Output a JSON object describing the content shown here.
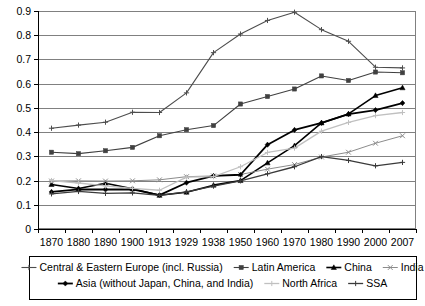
{
  "chart_data": {
    "type": "line",
    "title": "",
    "subtitle": "",
    "xlabel": "",
    "ylabel": "",
    "grid": true,
    "legend_position": "bottom",
    "ylim": [
      0,
      0.9
    ],
    "ytick_labels": [
      "0",
      "0.1",
      "0.2",
      "0.3",
      "0.4",
      "0.5",
      "0.6",
      "0.7",
      "0.8",
      "0.9"
    ],
    "ytick_values": [
      0,
      0.1,
      0.2,
      0.3,
      0.4,
      0.5,
      0.6,
      0.7,
      0.8,
      0.9
    ],
    "categories": [
      "1870",
      "1880",
      "1890",
      "1900",
      "1913",
      "1929",
      "1938",
      "1950",
      "1960",
      "1970",
      "1980",
      "1990",
      "2000",
      "2007"
    ],
    "series": [
      {
        "name": "Central & Eastern Europe (incl. Russia)",
        "color": "#4d4d4d",
        "width": 1.1,
        "marker": "plus",
        "values": [
          0.416,
          0.429,
          0.441,
          0.482,
          0.481,
          0.562,
          0.728,
          0.805,
          0.861,
          0.895,
          0.823,
          0.775,
          0.668,
          0.665
        ]
      },
      {
        "name": "Latin America",
        "color": "#404040",
        "width": 1.1,
        "marker": "square",
        "values": [
          0.317,
          0.311,
          0.323,
          0.337,
          0.385,
          0.41,
          0.427,
          0.516,
          0.547,
          0.578,
          0.632,
          0.613,
          0.648,
          0.645
        ]
      },
      {
        "name": "China",
        "color": "#000000",
        "width": 1.6,
        "marker": "triangle",
        "values": [
          0.184,
          0.167,
          0.189,
          0.166,
          0.139,
          0.152,
          0.181,
          0.2,
          0.273,
          0.344,
          0.438,
          0.475,
          0.551,
          0.583
        ]
      },
      {
        "name": "India",
        "color": "#8c8c8c",
        "width": 1.0,
        "marker": "x",
        "values": [
          0.198,
          0.199,
          0.198,
          0.199,
          0.203,
          0.216,
          0.219,
          0.225,
          0.247,
          0.266,
          0.297,
          0.317,
          0.354,
          0.385
        ]
      },
      {
        "name": "Asia (without Japan, China, and India)",
        "color": "#000000",
        "width": 1.8,
        "marker": "diamond",
        "values": [
          0.153,
          0.164,
          0.163,
          0.164,
          0.14,
          0.191,
          0.219,
          0.224,
          0.348,
          0.409,
          0.438,
          0.474,
          0.491,
          0.52
        ]
      },
      {
        "name": "North Africa",
        "color": "#c0c0c0",
        "width": 1.3,
        "marker": "plus",
        "values": [
          0.2,
          0.19,
          0.178,
          0.168,
          0.16,
          0.214,
          0.216,
          0.257,
          0.316,
          0.334,
          0.404,
          0.44,
          0.468,
          0.481
        ]
      },
      {
        "name": "SSA",
        "color": "#3a3a3a",
        "width": 1.3,
        "marker": "plus",
        "values": [
          0.145,
          0.155,
          0.147,
          0.149,
          0.139,
          0.153,
          0.177,
          0.199,
          0.228,
          0.257,
          0.299,
          0.283,
          0.261,
          0.275
        ]
      }
    ]
  },
  "legend": {
    "entries": [
      {
        "label": "Central & Eastern Europe (incl. Russia)"
      },
      {
        "label": "Latin America"
      },
      {
        "label": "China"
      },
      {
        "label": "India"
      },
      {
        "label": "Asia (without Japan, China, and India)"
      },
      {
        "label": "North Africa"
      },
      {
        "label": "SSA"
      }
    ]
  }
}
